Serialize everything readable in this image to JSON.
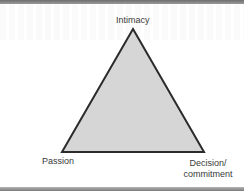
{
  "diagram": {
    "title": "",
    "shape": "triangle",
    "fill_color": "#d6d6d6",
    "stroke_color": "#2b2b2b",
    "vertices": {
      "top": {
        "label": "Intimacy",
        "x": 133,
        "y": 29
      },
      "bottom_left": {
        "label": "Passion",
        "x": 62,
        "y": 152
      },
      "bottom_right": {
        "label": "Decision/ commitment",
        "x": 204,
        "y": 152
      }
    },
    "labels": {
      "top": "Intimacy",
      "left": "Passion",
      "right": "Decision/ commitment"
    }
  },
  "frame": {
    "top_bar_color": "#7a7a7a",
    "bottom_bar_color": "#8a8a8a"
  }
}
